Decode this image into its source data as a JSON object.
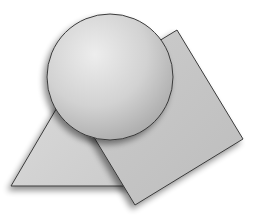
{
  "canvas": {
    "width": 253,
    "height": 224,
    "background": "#ffffff"
  },
  "shapes": {
    "triangle": {
      "kind": "triangle",
      "points": "11,186 92,48 150,186",
      "fill": "#d4d4d4",
      "stroke": "#3a3a3a"
    },
    "square": {
      "kind": "square",
      "rotated": true,
      "points": "177,30 243,139 135,205 69,96",
      "fill": "#c6c6c6",
      "stroke": "#3a3a3a"
    },
    "circle": {
      "kind": "circle",
      "cx": 110,
      "cy": 77,
      "r": 63,
      "fill_light": "#ececec",
      "fill_dark": "#aeaeae",
      "stroke": "#3a3a3a"
    }
  },
  "shadow": {
    "color": "#000000",
    "opacity": 0.45,
    "dx": -3,
    "dy": 4,
    "blur": 3
  }
}
